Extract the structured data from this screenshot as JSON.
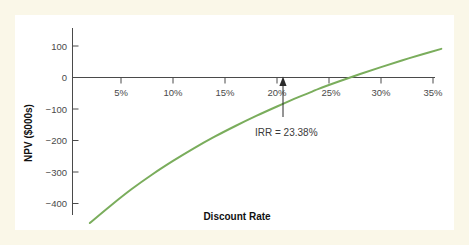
{
  "figure": {
    "frame_color": "#faf7e8",
    "plot_background": "#ffffff",
    "curve_color": "#7aad5c",
    "axis_color": "#4a4a4a"
  },
  "chart_data": {
    "type": "line",
    "title": "",
    "xlabel": "Discount Rate",
    "ylabel": "NPV ($000s)",
    "xlim": [
      0,
      37
    ],
    "ylim": [
      -480,
      160
    ],
    "grid": false,
    "legend": null,
    "x_ticks": [
      {
        "value": 5,
        "label": "5%"
      },
      {
        "value": 10,
        "label": "10%"
      },
      {
        "value": 15,
        "label": "15%"
      },
      {
        "value": 20,
        "label": "20%"
      },
      {
        "value": 25,
        "label": "25%"
      },
      {
        "value": 30,
        "label": "30%"
      },
      {
        "value": 35,
        "label": "35%"
      }
    ],
    "y_ticks": [
      {
        "value": 100,
        "label": "100"
      },
      {
        "value": 0,
        "label": "0"
      },
      {
        "value": -100,
        "label": "−100"
      },
      {
        "value": -200,
        "label": "−200"
      },
      {
        "value": -300,
        "label": "−300"
      },
      {
        "value": -400,
        "label": "−400"
      }
    ],
    "series": [
      {
        "name": "NPV profile",
        "color": "#7aad5c",
        "x": [
          2.0,
          4.0,
          6.0,
          8.0,
          10.0,
          12.0,
          14.0,
          16.0,
          18.0,
          20.0,
          22.0,
          23.38,
          24.0,
          26.0,
          28.0,
          30.0,
          32.0,
          34.0,
          35.8
        ],
        "y": [
          -462,
          -407,
          -355,
          -308,
          -265,
          -225,
          -188,
          -154,
          -122,
          -92,
          -63,
          -45,
          -36,
          -12,
          11,
          33,
          54,
          74,
          91
        ],
        "y_unit": "$000s"
      }
    ],
    "annotations": [
      {
        "name": "irr-annotation",
        "text": "IRR = 23.38%",
        "x": 23.38,
        "y": 0,
        "marker": "up-arrow",
        "description": "Zero-crossing of the NPV profile, internal rate of return"
      }
    ]
  },
  "labels": {
    "x_axis_title": "Discount Rate",
    "y_axis_title": "NPV ($000s)",
    "irr_text": "IRR = 23.38%"
  }
}
